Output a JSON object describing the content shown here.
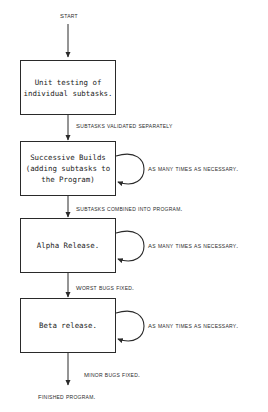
{
  "diagram": {
    "start_label": "Start",
    "end_label": "Finished Program.",
    "stroke_color": "#2a2a2a",
    "background_color": "#ffffff",
    "nodes": [
      {
        "id": "unit-testing",
        "text": "Unit testing of\nindividual subtasks.",
        "has_loop": false
      },
      {
        "id": "successive-builds",
        "text": "Successive Builds\n(adding subtasks to\nthe Program)",
        "has_loop": true,
        "loop_label": "As many times as necessary."
      },
      {
        "id": "alpha-release",
        "text": "Alpha Release.",
        "has_loop": true,
        "loop_label": "As many times as necessary."
      },
      {
        "id": "beta-release",
        "text": "Beta release.",
        "has_loop": true,
        "loop_label": "As many times as necessary."
      }
    ],
    "transitions": [
      {
        "id": "t1",
        "label": "Subtasks validated separately"
      },
      {
        "id": "t2",
        "label": "Subtasks combined into program."
      },
      {
        "id": "t3",
        "label": "Worst bugs fixed."
      },
      {
        "id": "t4",
        "label": "Minor bugs fixed."
      }
    ]
  }
}
